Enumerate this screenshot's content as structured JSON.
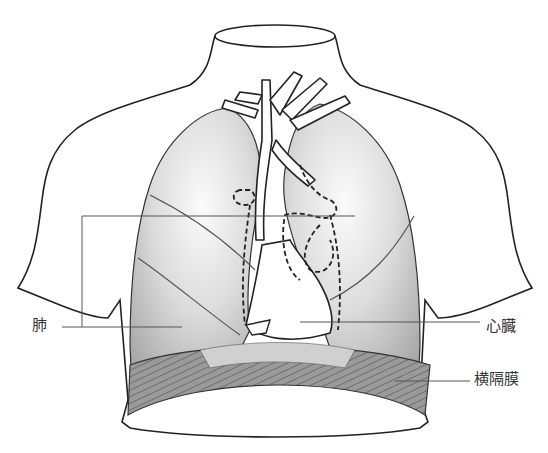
{
  "diagram": {
    "type": "anatomical-illustration",
    "colors": {
      "outline": "#222222",
      "lung_fill_light": "#f2f2f2",
      "lung_fill_dark": "#b5b5b5",
      "diaphragm_fill": "#8a8a8a",
      "leader_line": "#555555",
      "label_text": "#333333"
    },
    "labels": [
      {
        "id": "lung",
        "text": "肺"
      },
      {
        "id": "heart",
        "text": "心臓"
      },
      {
        "id": "diaphragm",
        "text": "横隔膜"
      }
    ]
  }
}
